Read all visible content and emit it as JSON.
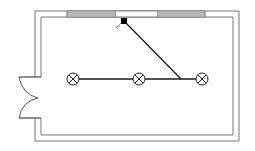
{
  "diagram": {
    "type": "electrical-floor-plan",
    "title": "",
    "colors": {
      "background": "#ffffff",
      "wall": "#777777",
      "window_fill": "#c8c8c8",
      "wire": "#1a1a1a",
      "switch": "#000000",
      "lamp": "#222222"
    },
    "room": {
      "outer": {
        "x": 35,
        "y": 11,
        "w": 204,
        "h": 130
      },
      "inner": {
        "x": 41,
        "y": 17,
        "w": 192,
        "h": 118
      }
    },
    "windows": [
      {
        "name": "window-left",
        "x": 67,
        "w": 49
      },
      {
        "name": "window-right",
        "x": 157,
        "w": 48
      }
    ],
    "door": {
      "top_y": 77,
      "bottom_y": 118,
      "meet_y": 98,
      "leaf_x": 19
    },
    "switch": {
      "x": 124,
      "y": 21,
      "label": "switch"
    },
    "lamps": [
      {
        "name": "lamp-1",
        "cx": 73,
        "cy": 79,
        "r": 6
      },
      {
        "name": "lamp-2",
        "cx": 139,
        "cy": 79,
        "r": 6
      },
      {
        "name": "lamp-3",
        "cx": 202,
        "cy": 79,
        "r": 6
      }
    ],
    "junction": {
      "x": 181,
      "y": 79
    }
  }
}
